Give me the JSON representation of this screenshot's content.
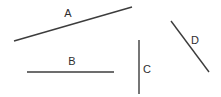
{
  "figure": {
    "width": 221,
    "height": 97,
    "background_color": "#ffffff",
    "stroke_color": "#3c3c3c",
    "label_color": "#2e2e2e"
  },
  "chart_data": {
    "type": "scatter",
    "title": "",
    "subtitle": "",
    "xlabel": "",
    "ylabel": "",
    "xlim": [
      0,
      221
    ],
    "ylim": [
      0,
      97
    ],
    "grid": false,
    "legend": "none",
    "note": "Four straight line segments labeled A-D drawn on a plain white canvas; coordinates are in image pixel space with y increasing downward.",
    "series": [
      {
        "name": "A",
        "label": "A",
        "x": [
          14,
          132
        ],
        "y": [
          41,
          7
        ],
        "label_x": 68,
        "label_y": 14,
        "orientation": "diagonal-rising",
        "length_px": 123
      },
      {
        "name": "B",
        "label": "B",
        "x": [
          27,
          114
        ],
        "y": [
          72,
          72
        ],
        "label_x": 72,
        "label_y": 62,
        "orientation": "horizontal",
        "length_px": 87
      },
      {
        "name": "C",
        "label": "C",
        "x": [
          139,
          139
        ],
        "y": [
          40,
          94
        ],
        "label_x": 147,
        "label_y": 70,
        "orientation": "vertical",
        "length_px": 54
      },
      {
        "name": "D",
        "label": "D",
        "x": [
          171,
          209
        ],
        "y": [
          21,
          72
        ],
        "label_x": 195,
        "label_y": 41,
        "orientation": "diagonal-falling",
        "length_px": 64
      }
    ]
  }
}
